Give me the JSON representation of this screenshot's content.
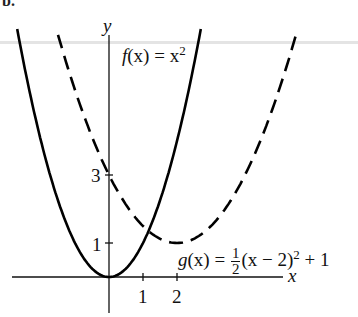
{
  "header": {
    "label": "b."
  },
  "chart_data": {
    "type": "line",
    "title": "",
    "xlabel": "x",
    "ylabel": "y",
    "x_ticks": [
      1,
      2
    ],
    "y_ticks": [
      1,
      3
    ],
    "grid": false,
    "legend": "inline annotations",
    "series": [
      {
        "name": "f(x) = x^2",
        "style": "solid",
        "color": "#000000",
        "points": [
          [
            -2.7,
            7.29
          ],
          [
            -2,
            4
          ],
          [
            -1,
            1
          ],
          [
            0,
            0
          ],
          [
            1,
            1
          ],
          [
            2,
            4
          ],
          [
            2.7,
            7.29
          ]
        ]
      },
      {
        "name": "g(x) = 1/2 (x - 2)^2 + 1",
        "style": "dashed",
        "color": "#000000",
        "points": [
          [
            -1.5,
            7.125
          ],
          [
            0,
            3
          ],
          [
            1,
            1.5
          ],
          [
            2,
            1
          ],
          [
            3,
            1.5
          ],
          [
            4,
            3
          ],
          [
            5.5,
            7.125
          ]
        ]
      }
    ],
    "annotations": [
      {
        "text": "f(x) = x^2",
        "near": [
          1.2,
          7
        ]
      },
      {
        "text": "g(x) = 1/2 (x - 2)^2 + 1",
        "near": [
          3.8,
          0.8
        ]
      },
      {
        "text": "intersection",
        "point": [
          1.1,
          1.3
        ]
      },
      {
        "text": "y-intercept of g",
        "point": [
          0,
          3
        ]
      }
    ]
  },
  "labels": {
    "y_axis": "y",
    "x_axis": "x",
    "tick_x1": "1",
    "tick_x2": "2",
    "tick_y1": "1",
    "tick_y3": "3",
    "f_name": "f",
    "f_arg": "(x) = x",
    "f_exp": "2",
    "g_name": "g",
    "g_arg": "(x) =",
    "g_num": "1",
    "g_den": "2",
    "g_rest": "(x − 2)",
    "g_exp": "2",
    "g_tail": " + 1"
  }
}
